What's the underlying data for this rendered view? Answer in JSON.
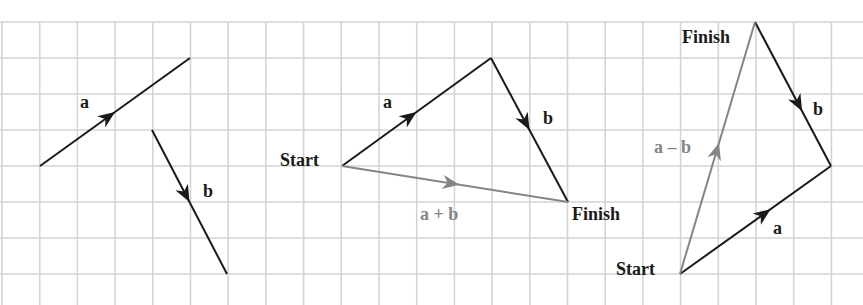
{
  "colors": {
    "background": "#ffffff",
    "grid": "#d4d4d4",
    "vector_black": "#1a1a1a",
    "vector_gray": "#858585"
  },
  "grid": {
    "x_lines": [
      2,
      39.7,
      77.4,
      115.1,
      152.8,
      190.5,
      228.2,
      265.9,
      303.6,
      341.3,
      379,
      416.7,
      454.4,
      492.1,
      529.8,
      567.5,
      605.2,
      642.9,
      680.6,
      718.3,
      756,
      793.7,
      831.4
    ],
    "y_lines": [
      22,
      58,
      94,
      130,
      166,
      202,
      238,
      274
    ]
  },
  "panels": [
    {
      "name": "separate-vectors",
      "vectors": [
        {
          "id": "a",
          "label": "a",
          "color": "black",
          "from": [
            40,
            166
          ],
          "to": [
            190,
            58
          ],
          "arrow_t": 0.5,
          "label_pos": [
            80,
            108
          ]
        },
        {
          "id": "b",
          "label": "b",
          "color": "black",
          "from": [
            152,
            130
          ],
          "to": [
            227,
            274
          ],
          "arrow_t": 0.5,
          "label_pos": [
            203,
            197
          ]
        }
      ],
      "texts": []
    },
    {
      "name": "vector-sum",
      "vectors": [
        {
          "id": "a",
          "label": "a",
          "color": "black",
          "from": [
            342,
            166
          ],
          "to": [
            491,
            58
          ],
          "arrow_t": 0.5,
          "label_pos": [
            383,
            108
          ]
        },
        {
          "id": "b",
          "label": "b",
          "color": "black",
          "from": [
            491,
            58
          ],
          "to": [
            568,
            202
          ],
          "arrow_t": 0.5,
          "label_pos": [
            543,
            124
          ]
        },
        {
          "id": "a-plus-b",
          "label": "a + b",
          "color": "gray",
          "from": [
            342,
            166
          ],
          "to": [
            568,
            202
          ],
          "arrow_t": 0.52,
          "label_pos": [
            420,
            220
          ]
        }
      ],
      "texts": [
        {
          "id": "start",
          "text": "Start",
          "pos": [
            280,
            166
          ],
          "color": "black"
        },
        {
          "id": "finish",
          "text": "Finish",
          "pos": [
            572,
            220
          ],
          "color": "black"
        }
      ]
    },
    {
      "name": "vector-difference",
      "vectors": [
        {
          "id": "a",
          "label": "a",
          "color": "black",
          "from": [
            680,
            274
          ],
          "to": [
            831,
            166
          ],
          "arrow_t": 0.6,
          "label_pos": [
            773,
            234
          ]
        },
        {
          "id": "b",
          "label": "b",
          "color": "black",
          "from": [
            755,
            22
          ],
          "to": [
            831,
            166
          ],
          "arrow_t": 0.62,
          "label_pos": [
            813,
            115
          ]
        },
        {
          "id": "a-minus-b",
          "label": "a – b",
          "color": "gray",
          "from": [
            680,
            274
          ],
          "to": [
            755,
            22
          ],
          "arrow_t": 0.52,
          "label_pos": [
            654,
            153
          ]
        }
      ],
      "texts": [
        {
          "id": "start",
          "text": "Start",
          "pos": [
            616,
            275
          ],
          "color": "black"
        },
        {
          "id": "finish",
          "text": "Finish",
          "pos": [
            682,
            43
          ],
          "color": "black"
        }
      ]
    }
  ]
}
